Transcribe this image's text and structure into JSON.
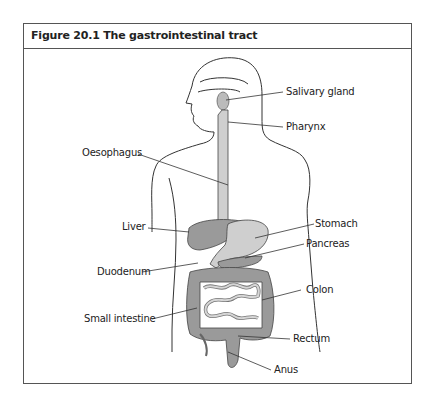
{
  "figure": {
    "title": "Figure 20.1 The gastrointestinal tract",
    "labels": {
      "salivary_gland": "Salivary gland",
      "pharynx": "Pharynx",
      "oesophagus": "Oesophagus",
      "liver": "Liver",
      "stomach": "Stomach",
      "pancreas": "Pancreas",
      "duodenum": "Duodenum",
      "colon": "Colon",
      "small_intestine": "Small intestine",
      "rectum": "Rectum",
      "anus": "Anus"
    },
    "colors": {
      "organ_dark": "#9a9a9a",
      "organ_light": "#cfcfcf",
      "outline": "#333333"
    }
  }
}
